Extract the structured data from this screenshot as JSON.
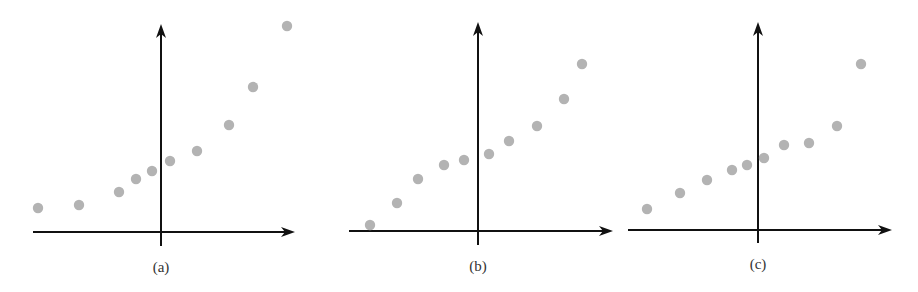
{
  "figure": {
    "width": 918,
    "height": 292,
    "point_color": "#b3b3b3",
    "axis_color": "#111111",
    "panels": [
      {
        "id": "a",
        "label": "(a)",
        "axes": {
          "origin_x": 161,
          "origin_y": 232,
          "x_start": 33,
          "x_end": 295,
          "y_top": 24,
          "y_bottom": 246
        },
        "label_pos": [
          161,
          272
        ],
        "points": [
          [
            38,
            208
          ],
          [
            79,
            205
          ],
          [
            119,
            192
          ],
          [
            136,
            179
          ],
          [
            152,
            171
          ],
          [
            170,
            161
          ],
          [
            197,
            151
          ],
          [
            229,
            125
          ],
          [
            253,
            87
          ],
          [
            287,
            26
          ]
        ]
      },
      {
        "id": "b",
        "label": "(b)",
        "axes": {
          "origin_x": 478,
          "origin_y": 231,
          "x_start": 349,
          "x_end": 613,
          "y_top": 22,
          "y_bottom": 245
        },
        "label_pos": [
          478,
          271
        ],
        "points": [
          [
            370,
            225
          ],
          [
            397,
            203
          ],
          [
            418,
            179
          ],
          [
            444,
            165
          ],
          [
            464,
            160
          ],
          [
            489,
            154
          ],
          [
            509,
            141
          ],
          [
            537,
            126
          ],
          [
            564,
            99
          ],
          [
            582,
            64
          ]
        ]
      },
      {
        "id": "c",
        "label": "(c)",
        "axes": {
          "origin_x": 758,
          "origin_y": 230,
          "x_start": 628,
          "x_end": 892,
          "y_top": 22,
          "y_bottom": 243
        },
        "label_pos": [
          758,
          269
        ],
        "points": [
          [
            647,
            209
          ],
          [
            680,
            193
          ],
          [
            707,
            180
          ],
          [
            732,
            170
          ],
          [
            747,
            165
          ],
          [
            764,
            158
          ],
          [
            784,
            145
          ],
          [
            809,
            143
          ],
          [
            837,
            126
          ],
          [
            861,
            64
          ]
        ]
      }
    ]
  },
  "chart_data": [
    {
      "type": "scatter",
      "title": "(a)",
      "xlabel": "",
      "ylabel": "",
      "description": "Convex upward (accelerating) trend",
      "x": [
        -6.1,
        -4.0,
        -2.0,
        -1.2,
        -0.4,
        0.5,
        1.8,
        3.4,
        4.6,
        6.3
      ],
      "y": [
        1.2,
        1.3,
        2.0,
        2.7,
        3.1,
        3.6,
        4.1,
        5.5,
        7.4,
        10.4
      ],
      "grid": false
    },
    {
      "type": "scatter",
      "title": "(b)",
      "xlabel": "",
      "ylabel": "",
      "description": "Concave-then-convex (S-shaped) trend",
      "x": [
        -5.4,
        -4.0,
        -3.0,
        -1.7,
        -0.7,
        0.6,
        1.6,
        3.0,
        4.3,
        5.2
      ],
      "y": [
        0.3,
        1.4,
        2.6,
        3.3,
        3.6,
        3.9,
        4.5,
        5.3,
        6.6,
        8.4
      ],
      "grid": false
    },
    {
      "type": "scatter",
      "title": "(c)",
      "xlabel": "",
      "ylabel": "",
      "description": "Roughly linear trend with an outlier at the far right",
      "x": [
        -5.6,
        -3.9,
        -2.6,
        -1.3,
        -0.6,
        0.3,
        1.3,
        2.6,
        4.0,
        5.2
      ],
      "y": [
        1.1,
        1.9,
        2.5,
        3.0,
        3.3,
        3.6,
        4.3,
        4.4,
        5.2,
        8.3
      ],
      "grid": false
    }
  ]
}
